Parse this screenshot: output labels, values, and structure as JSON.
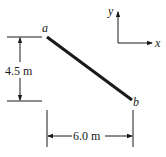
{
  "diagram": {
    "member": {
      "start_label": "a",
      "end_label": "b"
    },
    "dimensions": {
      "vertical": "4.5 m",
      "horizontal": "6.0 m"
    },
    "axes": {
      "x_label": "x",
      "y_label": "y"
    },
    "colors": {
      "ink": "#1a1a1a",
      "background": "#ffffff"
    }
  }
}
